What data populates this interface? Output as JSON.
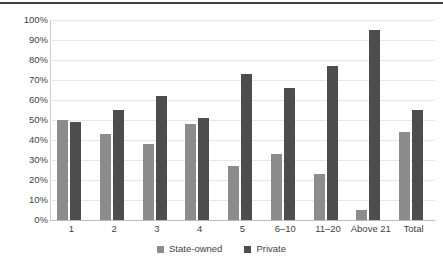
{
  "chart_data": {
    "type": "bar",
    "title": "",
    "subtitle": "",
    "xlabel": "",
    "ylabel": "",
    "categories": [
      "1",
      "2",
      "3",
      "4",
      "5",
      "6–10",
      "11–20",
      "Above 21",
      "Total"
    ],
    "series": [
      {
        "name": "State-owned",
        "color": "#8c8c8c",
        "values": [
          50,
          43,
          38,
          48,
          27,
          33,
          23,
          5,
          44
        ]
      },
      {
        "name": "Private",
        "color": "#4d4d4d",
        "values": [
          49,
          55,
          62,
          51,
          73,
          66,
          77,
          95,
          55
        ]
      }
    ],
    "ylim": [
      0,
      100
    ],
    "ytick_values": [
      0,
      10,
      20,
      30,
      40,
      50,
      60,
      70,
      80,
      90,
      100
    ],
    "ytick_labels": [
      "0%",
      "10%",
      "20%",
      "30%",
      "40%",
      "50%",
      "60%",
      "70%",
      "80%",
      "90%",
      "100%"
    ],
    "value_suffix": "%",
    "grid": true,
    "grid_axis": "y",
    "legend_position": "bottom",
    "legend_entries": [
      "State-owned",
      "Private"
    ]
  }
}
